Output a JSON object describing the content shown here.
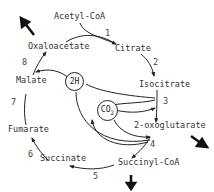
{
  "metabolites": {
    "acetyl_coa": "Acetyl-CoA",
    "citrate": "Citrate",
    "isocitrate": "Isocitrate",
    "oxoglutarate": "2-oxoglutarate",
    "succinyl_coa": "Succinyl-CoA",
    "succinate": "Succinate",
    "fumarate": "Fumarate",
    "malate": "Malate",
    "oxaloacetate": "Oxaloacetate"
  },
  "steps": [
    "1",
    "2",
    "3",
    "4",
    "5",
    "6",
    "7",
    "8"
  ],
  "cofactors": {
    "hydrogen": "2H",
    "co2_main": "CO",
    "co2_sub": "2"
  }
}
